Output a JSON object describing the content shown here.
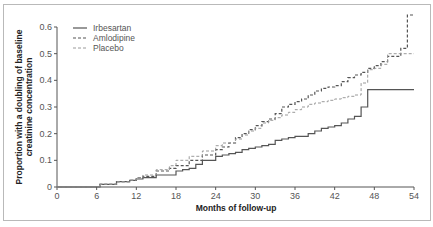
{
  "chart_data": {
    "type": "line",
    "subtype": "kaplan-meier-step",
    "title": "",
    "xlabel": "Months of follow-up",
    "ylabel_lines": [
      "Proportion with a doubling of baseline",
      "creatinine concentration"
    ],
    "ylabel": "Proportion with a doubling of baseline creatinine concentration",
    "xlim": [
      0,
      54
    ],
    "ylim": [
      0,
      0.6
    ],
    "x_ticks": [
      "0",
      "6",
      "12",
      "18",
      "24",
      "30",
      "36",
      "42",
      "48",
      "54"
    ],
    "y_ticks": [
      "0",
      "0.1",
      "0.2",
      "0.3",
      "0.4",
      "0.5",
      "0.6"
    ],
    "grid": false,
    "legend_position": "upper-left",
    "series": [
      {
        "name": "Irbesartan",
        "style": "solid",
        "color": "#555555",
        "x": [
          0,
          6,
          6.5,
          9,
          11,
          12,
          13,
          15,
          18,
          19,
          20,
          21,
          22,
          24,
          25,
          26,
          27,
          28,
          29,
          30,
          31,
          32,
          33,
          34,
          35,
          36,
          37,
          38,
          39,
          40,
          41,
          42,
          43,
          44,
          45,
          46,
          47,
          54
        ],
        "y": [
          0,
          0,
          0.01,
          0.02,
          0.025,
          0.03,
          0.035,
          0.045,
          0.06,
          0.065,
          0.07,
          0.085,
          0.1,
          0.115,
          0.12,
          0.125,
          0.13,
          0.14,
          0.145,
          0.15,
          0.155,
          0.16,
          0.175,
          0.18,
          0.185,
          0.19,
          0.19,
          0.2,
          0.21,
          0.22,
          0.225,
          0.23,
          0.24,
          0.255,
          0.265,
          0.3,
          0.365,
          0.365
        ]
      },
      {
        "name": "Amlodipine",
        "style": "dashed",
        "color": "#555555",
        "x": [
          0,
          6,
          6.5,
          9,
          11,
          12,
          13,
          15,
          17,
          18,
          20,
          22,
          24,
          25,
          26,
          27,
          28,
          29,
          30,
          31,
          32,
          33,
          34,
          35,
          36,
          37,
          38,
          39,
          40,
          41,
          42,
          43,
          44,
          45,
          46,
          47,
          48,
          49,
          50,
          52,
          52.5,
          53,
          54
        ],
        "y": [
          0,
          0,
          0.01,
          0.02,
          0.025,
          0.035,
          0.04,
          0.06,
          0.07,
          0.08,
          0.1,
          0.12,
          0.14,
          0.15,
          0.165,
          0.185,
          0.2,
          0.215,
          0.23,
          0.245,
          0.255,
          0.275,
          0.3,
          0.31,
          0.32,
          0.33,
          0.345,
          0.36,
          0.37,
          0.375,
          0.38,
          0.395,
          0.41,
          0.42,
          0.43,
          0.445,
          0.455,
          0.47,
          0.49,
          0.52,
          0.52,
          0.645,
          0.645
        ]
      },
      {
        "name": "Placebo",
        "style": "dashed-light",
        "color": "#9a9a9a",
        "x": [
          0,
          6,
          6.5,
          9,
          11,
          12,
          13,
          15,
          17,
          18,
          20,
          22,
          24,
          25,
          27,
          28,
          29,
          30,
          31,
          32,
          33,
          34,
          35,
          36,
          37,
          38,
          39,
          40,
          41,
          42,
          43,
          44,
          45,
          46,
          47,
          48,
          49,
          50,
          54
        ],
        "y": [
          0,
          0,
          0.01,
          0.02,
          0.025,
          0.035,
          0.045,
          0.065,
          0.08,
          0.1,
          0.115,
          0.135,
          0.155,
          0.165,
          0.18,
          0.195,
          0.21,
          0.22,
          0.24,
          0.25,
          0.26,
          0.27,
          0.28,
          0.29,
          0.3,
          0.31,
          0.315,
          0.32,
          0.325,
          0.33,
          0.335,
          0.34,
          0.345,
          0.39,
          0.44,
          0.445,
          0.46,
          0.5,
          0.5
        ]
      }
    ]
  },
  "legend": {
    "items": [
      {
        "label": "Irbesartan",
        "style": "solid"
      },
      {
        "label": "Amlodipine",
        "style": "dashed"
      },
      {
        "label": "Placebo",
        "style": "dashed-light"
      }
    ]
  },
  "colors": {
    "axis": "#555555",
    "frame": "#b9b9b9",
    "irbesartan": "#555555",
    "amlodipine": "#555555",
    "placebo": "#9a9a9a"
  }
}
